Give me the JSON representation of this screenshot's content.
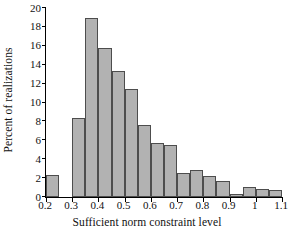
{
  "chart_data": {
    "type": "bar",
    "title": "",
    "xlabel": "Sufficient norm constraint level",
    "ylabel": "Percent of realizations",
    "xlim": [
      0.2,
      1.1
    ],
    "ylim": [
      0,
      20
    ],
    "grid": false,
    "legend": null,
    "bin_width": 0.05,
    "xticks": [
      "0.2",
      "0.3",
      "0.4",
      "0.5",
      "0.6",
      "0.7",
      "0.8",
      "0.9",
      "1",
      "1.1"
    ],
    "xtick_values": [
      0.2,
      0.3,
      0.4,
      0.5,
      0.6,
      0.7,
      0.8,
      0.9,
      1.0,
      1.1
    ],
    "yticks": [
      "0",
      "2",
      "4",
      "6",
      "8",
      "10",
      "12",
      "14",
      "16",
      "18",
      "20"
    ],
    "ytick_values": [
      0,
      2,
      4,
      6,
      8,
      10,
      12,
      14,
      16,
      18,
      20
    ],
    "bin_edges": [
      0.2,
      0.25,
      0.3,
      0.35,
      0.4,
      0.45,
      0.5,
      0.55,
      0.6,
      0.65,
      0.7,
      0.75,
      0.8,
      0.85,
      0.9,
      0.95,
      1.0,
      1.05,
      1.1
    ],
    "categories": [
      "0.20-0.25",
      "0.25-0.30",
      "0.30-0.35",
      "0.35-0.40",
      "0.40-0.45",
      "0.45-0.50",
      "0.50-0.55",
      "0.55-0.60",
      "0.60-0.65",
      "0.65-0.70",
      "0.70-0.75",
      "0.75-0.80",
      "0.80-0.85",
      "0.85-0.90",
      "0.90-0.95",
      "0.95-1.00",
      "1.00-1.05",
      "1.05-1.10"
    ],
    "values": [
      2.3,
      0.0,
      8.4,
      18.9,
      15.8,
      13.3,
      11.4,
      7.6,
      5.7,
      5.5,
      2.5,
      2.9,
      2.2,
      1.7,
      0.3,
      1.1,
      0.9,
      0.7
    ],
    "bar_color": "#b2b2b2",
    "bar_edge_color": "#4d4d4d",
    "axis_color": "#000000"
  }
}
